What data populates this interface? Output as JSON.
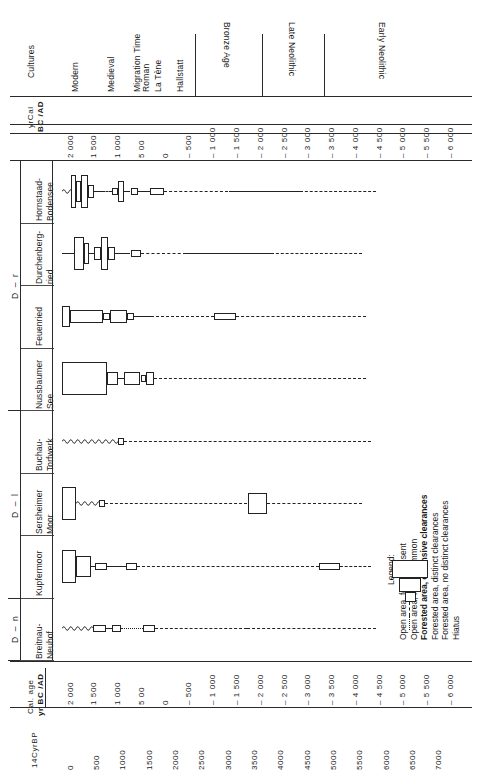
{
  "figure": {
    "kind": "archaeological-vegetation-chronology-chart",
    "cultures_header": "Cultures",
    "top_axis_title_line1": "yrCal",
    "top_axis_title_line2": "BC /AD",
    "bottom_axis_title_line1": "Cal. age",
    "bottom_axis_title_line2": "yr  BC /AD",
    "bottom_axis2_title": "14CyrBP"
  },
  "cultures": [
    {
      "label": "Modern",
      "start": 2000,
      "end": 1500
    },
    {
      "label": "Medieval",
      "start": 1500,
      "end": 500
    },
    {
      "label": "Migration Time",
      "start": 500,
      "end": 400
    },
    {
      "label": "Roman",
      "start": 400,
      "end": 100
    },
    {
      "label": "La Tène",
      "start": 100,
      "end": -100
    },
    {
      "label": "Hallstatt",
      "start": -100,
      "end": -800
    },
    {
      "label": "Bronze Age",
      "start": -800,
      "end": -2200
    },
    {
      "label": "Late Neolithic",
      "start": -2200,
      "end": -3500
    },
    {
      "label": "Early Neolithic",
      "start": -3500,
      "end": -6000
    }
  ],
  "culture_dividers_calbc": [
    -800,
    -2200,
    -3500
  ],
  "cal_axis_ticks": [
    "2 000",
    "1 500",
    "1 000",
    "5 00",
    "0",
    "– 500",
    "– 1 000",
    "– 1 500",
    "– 2 000",
    "– 2 500",
    "– 3 000",
    "– 3 500",
    "– 4 000",
    "– 4 500",
    "– 5 000",
    "– 5 500",
    "– 6 000"
  ],
  "cal_axis_values": [
    2000,
    1500,
    1000,
    500,
    0,
    -500,
    -1000,
    -1500,
    -2000,
    -2500,
    -3000,
    -3500,
    -4000,
    -4500,
    -5000,
    -5500,
    -6000
  ],
  "c14_axis_ticks": [
    "0",
    "500",
    "1000",
    "1500",
    "2000",
    "2500",
    "3000",
    "3500",
    "4000",
    "4500",
    "5000",
    "5500",
    "6000",
    "6500",
    "7000"
  ],
  "c14_axis_values": [
    0,
    500,
    1000,
    1500,
    2000,
    2500,
    3000,
    3500,
    4000,
    4500,
    5000,
    5500,
    6000,
    6500,
    7000
  ],
  "regions": [
    {
      "code": "D – r",
      "sites": [
        "Hornstaad-Bodensee",
        "Durchenberg-ried",
        "Feuenried",
        "Nussbaumer See"
      ]
    },
    {
      "code": "D – l",
      "sites": [
        "Buchau-Torfwerk",
        "Sersheimer Moor",
        "Kupfermoor"
      ]
    },
    {
      "code": "D – n",
      "sites": [
        "Breitnau-Neuhof"
      ]
    }
  ],
  "sites": [
    {
      "name_line1": "Hornstaad-",
      "name_line2": "Bodensee",
      "region": "D – r"
    },
    {
      "name_line1": "Durchenberg-",
      "name_line2": "ried",
      "region": "D – r"
    },
    {
      "name_line1": "Feuenried",
      "name_line2": "",
      "region": "D – r"
    },
    {
      "name_line1": "Nussbaumer",
      "name_line2": "See",
      "region": "D – r"
    },
    {
      "name_line1": "Buchau-",
      "name_line2": "Torfwerk",
      "region": "D – l"
    },
    {
      "name_line1": "Sersheimer",
      "name_line2": "Moor",
      "region": "D – l"
    },
    {
      "name_line1": "Kupfermoor",
      "name_line2": "",
      "region": "D – l"
    },
    {
      "name_line1": "Breitnau-",
      "name_line2": "Neuhof",
      "region": "D – n"
    }
  ],
  "legend": {
    "title": "Legend:",
    "items": [
      {
        "label": "Open area, forest present",
        "weight": "normal",
        "rank": 5
      },
      {
        "label": "Open area, forest common",
        "weight": "normal",
        "rank": 4
      },
      {
        "label": "Forested area, extensive clearances",
        "weight": "bold",
        "rank": 3
      },
      {
        "label": "Forested area, distinct clearances",
        "weight": "normal",
        "rank": 2
      },
      {
        "label": "Forested area, no distinct clearances",
        "weight": "normal",
        "rank": 1
      },
      {
        "label": "Hiatus",
        "weight": "normal",
        "rank": 0
      }
    ]
  },
  "chart_data": {
    "type": "table",
    "xlabel": "Cal. age yr BC /AD",
    "ylabel": "Site",
    "xlim": [
      2000,
      -6200
    ],
    "grid": false,
    "legend_position": "right",
    "series": [
      {
        "name": "Hornstaad-Bodensee",
        "values": [
          {
            "from": 2000,
            "to": 1820,
            "rank": 1,
            "style": "wavy"
          },
          {
            "from": 1820,
            "to": 1700,
            "rank": 5,
            "style": "box"
          },
          {
            "from": 1700,
            "to": 1600,
            "rank": 4,
            "style": "box"
          },
          {
            "from": 1600,
            "to": 1450,
            "rank": 5,
            "style": "box"
          },
          {
            "from": 1450,
            "to": 1330,
            "rank": 3,
            "style": "box"
          },
          {
            "from": 1330,
            "to": 1150,
            "rank": 1,
            "style": "solid"
          },
          {
            "from": 1150,
            "to": 950,
            "rank": 0,
            "style": "dashdot"
          },
          {
            "from": 950,
            "to": 820,
            "rank": 2,
            "style": "box"
          },
          {
            "from": 820,
            "to": 700,
            "rank": 4,
            "style": "box"
          },
          {
            "from": 700,
            "to": 560,
            "rank": 1,
            "style": "solid"
          },
          {
            "from": 560,
            "to": 400,
            "rank": 2,
            "style": "box"
          },
          {
            "from": 400,
            "to": 150,
            "rank": 1,
            "style": "solid"
          },
          {
            "from": 150,
            "to": -150,
            "rank": 2,
            "style": "box"
          },
          {
            "from": -150,
            "to": -1500,
            "rank": 0,
            "style": "dashed"
          },
          {
            "from": -1500,
            "to": -3000,
            "rank": 1,
            "style": "solid"
          },
          {
            "from": -3000,
            "to": -4600,
            "rank": 0,
            "style": "dashdot"
          }
        ]
      },
      {
        "name": "Durchenberg-ried",
        "values": [
          {
            "from": 2000,
            "to": 1740,
            "rank": 1,
            "style": "solid"
          },
          {
            "from": 1740,
            "to": 1540,
            "rank": 5,
            "style": "box"
          },
          {
            "from": 1540,
            "to": 1440,
            "rank": 4,
            "style": "box"
          },
          {
            "from": 1440,
            "to": 1330,
            "rank": 1,
            "style": "solid"
          },
          {
            "from": 1330,
            "to": 1180,
            "rank": 3,
            "style": "box"
          },
          {
            "from": 1180,
            "to": 1030,
            "rank": 5,
            "style": "box"
          },
          {
            "from": 1030,
            "to": 880,
            "rank": 3,
            "style": "box"
          },
          {
            "from": 880,
            "to": 560,
            "rank": 1,
            "style": "solid"
          },
          {
            "from": 560,
            "to": 330,
            "rank": 2,
            "style": "box"
          },
          {
            "from": 330,
            "to": -600,
            "rank": 0,
            "style": "dashdot"
          },
          {
            "from": -600,
            "to": -2400,
            "rank": 1,
            "style": "solid"
          },
          {
            "from": -2400,
            "to": -4300,
            "rank": 0,
            "style": "dashed"
          }
        ]
      },
      {
        "name": "Feuenried",
        "values": [
          {
            "from": 2000,
            "to": 1840,
            "rank": 4,
            "style": "box"
          },
          {
            "from": 1840,
            "to": 1140,
            "rank": 3,
            "style": "box"
          },
          {
            "from": 1140,
            "to": 1000,
            "rank": 2,
            "style": "box"
          },
          {
            "from": 1000,
            "to": 630,
            "rank": 3,
            "style": "box"
          },
          {
            "from": 630,
            "to": 480,
            "rank": 2,
            "style": "box"
          },
          {
            "from": 480,
            "to": 130,
            "rank": 1,
            "style": "solid"
          },
          {
            "from": 130,
            "to": -1200,
            "rank": 0,
            "style": "dashdot"
          },
          {
            "from": -1200,
            "to": -1650,
            "rank": 2,
            "style": "box"
          },
          {
            "from": -1650,
            "to": -4400,
            "rank": 0,
            "style": "dashed"
          }
        ]
      },
      {
        "name": "Nussbaumer See",
        "values": [
          {
            "from": 2000,
            "to": 1050,
            "rank": 5,
            "style": "box"
          },
          {
            "from": 1050,
            "to": 830,
            "rank": 3,
            "style": "box"
          },
          {
            "from": 830,
            "to": 700,
            "rank": 1,
            "style": "solid"
          },
          {
            "from": 700,
            "to": 350,
            "rank": 3,
            "style": "box"
          },
          {
            "from": 350,
            "to": 240,
            "rank": 2,
            "style": "box"
          },
          {
            "from": 240,
            "to": 60,
            "rank": 3,
            "style": "box"
          },
          {
            "from": 60,
            "to": -4400,
            "rank": 0,
            "style": "dashdot"
          }
        ]
      },
      {
        "name": "Buchau-Torfwerk",
        "values": [
          {
            "from": 2000,
            "to": 820,
            "rank": 1,
            "style": "wavy"
          },
          {
            "from": 820,
            "to": 700,
            "rank": 2,
            "style": "box"
          },
          {
            "from": 700,
            "to": -4500,
            "rank": 0,
            "style": "dashdot"
          }
        ]
      },
      {
        "name": "Sersheimer Moor",
        "values": [
          {
            "from": 2000,
            "to": 1700,
            "rank": 5,
            "style": "box"
          },
          {
            "from": 1700,
            "to": 1230,
            "rank": 1,
            "style": "wavy"
          },
          {
            "from": 1230,
            "to": 1090,
            "rank": 2,
            "style": "box"
          },
          {
            "from": 1090,
            "to": -1900,
            "rank": 0,
            "style": "dashdot"
          },
          {
            "from": -1900,
            "to": -2300,
            "rank": 4,
            "style": "box"
          },
          {
            "from": -2300,
            "to": -4300,
            "rank": 0,
            "style": "dashed"
          }
        ]
      },
      {
        "name": "Kupfermoor",
        "values": [
          {
            "from": 2000,
            "to": 1700,
            "rank": 5,
            "style": "box"
          },
          {
            "from": 1700,
            "to": 1400,
            "rank": 4,
            "style": "box"
          },
          {
            "from": 1400,
            "to": 1300,
            "rank": 1,
            "style": "solid"
          },
          {
            "from": 1300,
            "to": 1060,
            "rank": 2,
            "style": "box"
          },
          {
            "from": 1060,
            "to": 650,
            "rank": 1,
            "style": "solid"
          },
          {
            "from": 650,
            "to": 430,
            "rank": 2,
            "style": "box"
          },
          {
            "from": 430,
            "to": -3400,
            "rank": 0,
            "style": "dashdot"
          },
          {
            "from": -3400,
            "to": -3850,
            "rank": 2,
            "style": "box"
          },
          {
            "from": -3850,
            "to": -4500,
            "rank": 0,
            "style": "dashed"
          }
        ]
      },
      {
        "name": "Breitnau-Neuhof",
        "values": [
          {
            "from": 2000,
            "to": 1340,
            "rank": 1,
            "style": "wavy"
          },
          {
            "from": 1340,
            "to": 1080,
            "rank": 2,
            "style": "box"
          },
          {
            "from": 1080,
            "to": 940,
            "rank": 1,
            "style": "solid"
          },
          {
            "from": 940,
            "to": 760,
            "rank": 2,
            "style": "box"
          },
          {
            "from": 760,
            "to": 290,
            "rank": 0,
            "style": "dotted"
          },
          {
            "from": 290,
            "to": 40,
            "rank": 2,
            "style": "box"
          },
          {
            "from": 40,
            "to": -1900,
            "rank": 0,
            "style": "dashdot"
          },
          {
            "from": -1900,
            "to": -4600,
            "rank": 0,
            "style": "dashed"
          }
        ]
      }
    ]
  }
}
